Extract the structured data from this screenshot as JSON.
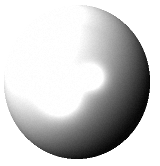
{
  "image": {
    "kind": "rendered-sphere",
    "title": "Shaded grey sphere on white background",
    "width": 160,
    "height": 166,
    "background_color": "#ffffff",
    "color_mode": "grayscale"
  },
  "sphere": {
    "name": "shaded-sphere",
    "center_x": 77,
    "center_y": 82,
    "radius_x": 73,
    "radius_y": 77,
    "edge_softness": 1.4,
    "base_color_light": "#ffffff",
    "base_color_mid": "#9b9b9b",
    "base_color_dark": "#050505",
    "ambient": 0.03,
    "light": {
      "name": "key-light",
      "direction_x": -0.62,
      "direction_y": -0.52,
      "direction_z": 0.59,
      "diffuse_intensity": 1.22,
      "terminator_softness": 0.55
    },
    "rim_light": {
      "name": "reflected-rim-light",
      "intensity": 0.17,
      "angle_deg": 255,
      "spread": 0.42,
      "radius_start": 0.74
    },
    "highlights": [
      {
        "name": "primary-specular-highlight",
        "x": 62,
        "y": 97,
        "radius": 26,
        "intensity": 0.92
      },
      {
        "name": "secondary-specular-highlight",
        "x": 93,
        "y": 78,
        "radius": 17,
        "intensity": 0.78
      }
    ],
    "noise": {
      "name": "film-grain",
      "amount": 7
    }
  },
  "fallback": {
    "label": "Shaded grey sphere"
  }
}
